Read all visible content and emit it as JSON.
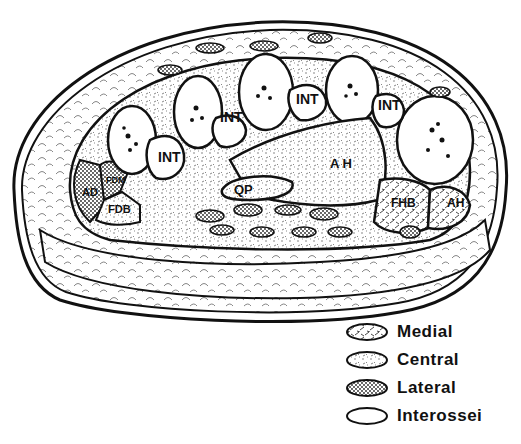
{
  "diagram": {
    "type": "anatomical cross-section",
    "labels": {
      "int1": "INT",
      "int2": "INT",
      "int3": "INT",
      "int4": "INT",
      "ah_main": "A H",
      "ah_side": "AH",
      "qp": "QP",
      "fhb": "FHB",
      "fdb": "FDB",
      "fdm": "FDM",
      "ad": "AD"
    }
  },
  "legend": {
    "items": [
      {
        "label": "Medial",
        "pattern": "hatch"
      },
      {
        "label": "Central",
        "pattern": "stipple"
      },
      {
        "label": "Lateral",
        "pattern": "crosshatch"
      },
      {
        "label": "Interossei",
        "pattern": "plain"
      }
    ]
  },
  "colors": {
    "ink": "#111111",
    "paper": "#ffffff"
  }
}
